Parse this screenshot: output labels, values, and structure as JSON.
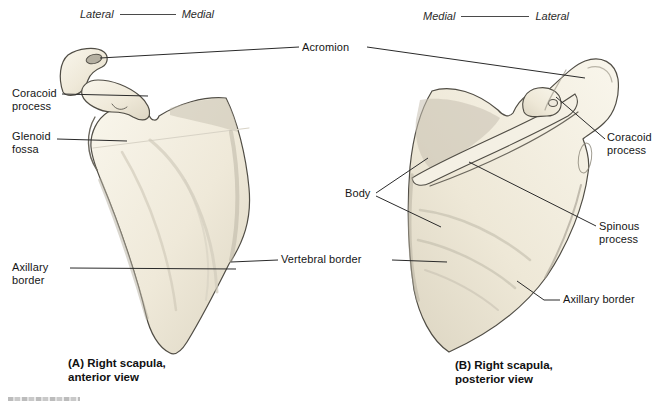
{
  "figure": {
    "orientation": {
      "left_pair": {
        "a": "Lateral",
        "b": "Medial"
      },
      "right_pair": {
        "a": "Medial",
        "b": "Lateral"
      }
    },
    "labels": {
      "acromion": "Acromion",
      "coracoid_left": "Coracoid process",
      "glenoid_fossa": "Glenoid fossa",
      "axillary_left": "Axillary border",
      "vertebral_border": "Vertebral border",
      "coracoid_right": "Coracoid process",
      "body": "Body",
      "spinous_process": "Spinous process",
      "axillary_right": "Axillary border"
    },
    "captions": {
      "a_line1": "(A) Right scapula,",
      "a_line2": "anterior view",
      "b_line1": "(B) Right scapula,",
      "b_line2": "posterior view"
    },
    "colors": {
      "bone_light": "#f8f5ea",
      "bone_mid": "#ece6d5",
      "bone_shadow": "#c7c1b0",
      "outline": "#504d45",
      "leader_line": "#2a2a2a",
      "text": "#161616"
    }
  }
}
